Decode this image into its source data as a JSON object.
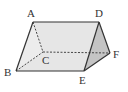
{
  "diagram": {
    "type": "triangular-prism",
    "vertices": {
      "A": {
        "label": "A",
        "x": 33,
        "y": 22,
        "lx": 27,
        "ly": 17
      },
      "B": {
        "label": "B",
        "x": 16,
        "y": 71,
        "lx": 4,
        "ly": 76
      },
      "C": {
        "label": "C",
        "x": 43,
        "y": 52,
        "lx": 42,
        "ly": 64
      },
      "D": {
        "label": "D",
        "x": 99,
        "y": 22,
        "lx": 95,
        "ly": 17
      },
      "E": {
        "label": "E",
        "x": 84,
        "y": 71,
        "lx": 79,
        "ly": 84
      },
      "F": {
        "label": "F",
        "x": 110,
        "y": 53,
        "lx": 113,
        "ly": 58
      }
    },
    "solid_edges": [
      [
        "A",
        "D"
      ],
      [
        "A",
        "B"
      ],
      [
        "B",
        "E"
      ],
      [
        "D",
        "E"
      ],
      [
        "D",
        "F"
      ],
      [
        "E",
        "F"
      ]
    ],
    "dashed_edges": [
      [
        "A",
        "C"
      ],
      [
        "B",
        "C"
      ],
      [
        "C",
        "F"
      ]
    ],
    "colors": {
      "front_face": "#e6e6e6",
      "side_face": "#c4c4c4",
      "edge": "#333333"
    }
  }
}
